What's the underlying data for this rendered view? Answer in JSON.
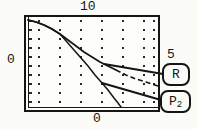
{
  "figure": {
    "axis_labels": {
      "top": "10",
      "left": "0",
      "bottom": "0",
      "right": "5"
    },
    "callouts": {
      "r": "R",
      "p2_base": "P",
      "p2_sub": "2"
    },
    "colors": {
      "ink": "#151515",
      "paper": "#fbfbf8"
    }
  },
  "chart_data": {
    "type": "line",
    "title": "",
    "xlabel": "",
    "ylabel": "",
    "xlim": [
      0,
      10
    ],
    "ylim": [
      0,
      5
    ],
    "axis_edge_labels": {
      "top": "10",
      "left": "0",
      "bottom": "0",
      "right": "5"
    },
    "grid": "vertical dotted gridlines only",
    "legend_position": "callout boxes right of plot with leader lines",
    "series": [
      {
        "name": "R",
        "style": "solid, dashed on right portion",
        "x": [
          0,
          1,
          2,
          3,
          4,
          5,
          6,
          7,
          8,
          9,
          10
        ],
        "y": [
          4.85,
          4.65,
          4.35,
          3.95,
          3.5,
          3.05,
          2.6,
          2.2,
          1.85,
          1.45,
          1.1
        ]
      },
      {
        "name": "P2",
        "style": "solid",
        "x": [
          0,
          1,
          2,
          3,
          4,
          5,
          6,
          7,
          7.2
        ],
        "y": [
          4.85,
          4.65,
          4.3,
          3.6,
          2.75,
          1.8,
          0.9,
          0.1,
          0
        ]
      }
    ],
    "pixel_paths": {
      "r_solid": [
        [
          28,
          20
        ],
        [
          36,
          22
        ],
        [
          44,
          25
        ],
        [
          52,
          29
        ],
        [
          60,
          34
        ],
        [
          68,
          40
        ],
        [
          76,
          46
        ],
        [
          84,
          52
        ],
        [
          92,
          57
        ],
        [
          100,
          62
        ],
        [
          108,
          66
        ],
        [
          116,
          70
        ]
      ],
      "r_dashed": [
        [
          116,
          70
        ],
        [
          126,
          75
        ],
        [
          136,
          79
        ],
        [
          146,
          82
        ],
        [
          158,
          86
        ]
      ],
      "p2": [
        [
          28,
          20
        ],
        [
          36,
          22
        ],
        [
          44,
          25
        ],
        [
          52,
          29
        ],
        [
          60,
          34
        ],
        [
          67,
          42
        ],
        [
          74,
          50
        ],
        [
          81,
          58
        ],
        [
          88,
          66
        ],
        [
          95,
          75
        ],
        [
          102,
          83
        ],
        [
          108,
          90
        ],
        [
          114,
          98
        ],
        [
          118,
          103
        ],
        [
          121,
          107
        ]
      ],
      "leader_r": [
        [
          104,
          64
        ],
        [
          163,
          74
        ]
      ],
      "leader_p2": [
        [
          102,
          83
        ],
        [
          161,
          100
        ]
      ]
    }
  }
}
